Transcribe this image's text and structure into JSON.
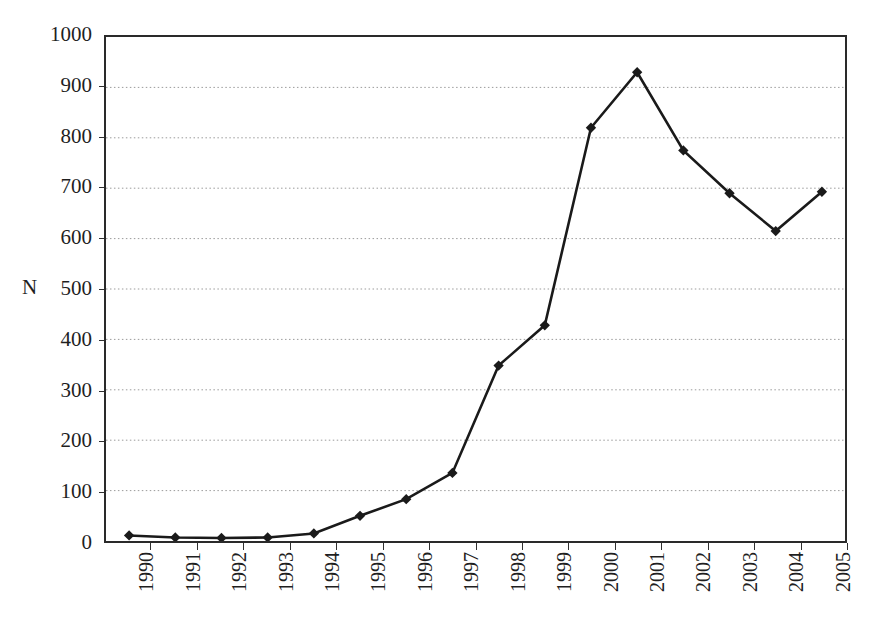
{
  "chart_data": {
    "type": "line",
    "title": "",
    "xlabel": "",
    "ylabel": "N",
    "categories": [
      "1990",
      "1991",
      "1992",
      "1993",
      "1994",
      "1995",
      "1996",
      "1997",
      "1998",
      "1999",
      "2000",
      "2001",
      "2002",
      "2003",
      "2004",
      "2005"
    ],
    "values": [
      11,
      7,
      6,
      7,
      15,
      50,
      83,
      135,
      348,
      428,
      820,
      930,
      775,
      690,
      615,
      693
    ],
    "series": [
      {
        "name": "N",
        "values": [
          11,
          7,
          6,
          7,
          15,
          50,
          83,
          135,
          348,
          428,
          820,
          930,
          775,
          690,
          615,
          693
        ]
      }
    ],
    "ylim": [
      0,
      1000
    ],
    "ytick_values": [
      0,
      100,
      200,
      300,
      400,
      500,
      600,
      700,
      800,
      900,
      1000
    ],
    "ytick_labels": [
      "0",
      "100",
      "200",
      "300",
      "400",
      "500",
      "600",
      "700",
      "800",
      "900",
      "1000"
    ],
    "grid": true,
    "grid_axis": "y",
    "grid_style": "dotted",
    "legend": false,
    "legend_position": "none",
    "marker": "diamond",
    "marker_color": "#1a1a1a",
    "line_color": "#1a1a1a",
    "background_color": "#ffffff",
    "xtick_rotation": -90
  }
}
